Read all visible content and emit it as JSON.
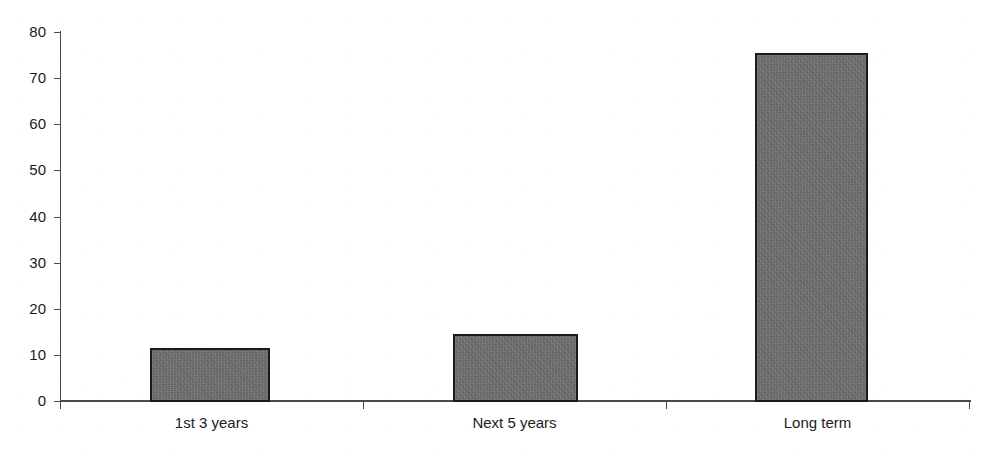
{
  "chart_data": {
    "type": "bar",
    "title": "",
    "subtitle": "",
    "xlabel": "",
    "ylabel": "",
    "categories": [
      "1st 3 years",
      "Next 5 years",
      "Long term"
    ],
    "values": [
      11.5,
      14.5,
      75.4
    ],
    "series": [
      {
        "name": "",
        "values": [
          11.5,
          14.5,
          75.4
        ]
      }
    ],
    "ylim": [
      0,
      80
    ],
    "yticks": [
      0,
      10,
      20,
      30,
      40,
      50,
      60,
      70,
      80
    ],
    "ytick_labels": [
      "0",
      "10",
      "20",
      "30",
      "40",
      "50",
      "60",
      "70",
      "80"
    ],
    "grid": false,
    "legend": false,
    "legend_position": "none",
    "bar_color": "#6e6e6e",
    "bar_edge_color": "#1a1a1a",
    "axis_color": "#4a4a4a",
    "background_color": "#ffffff",
    "annotations": []
  }
}
